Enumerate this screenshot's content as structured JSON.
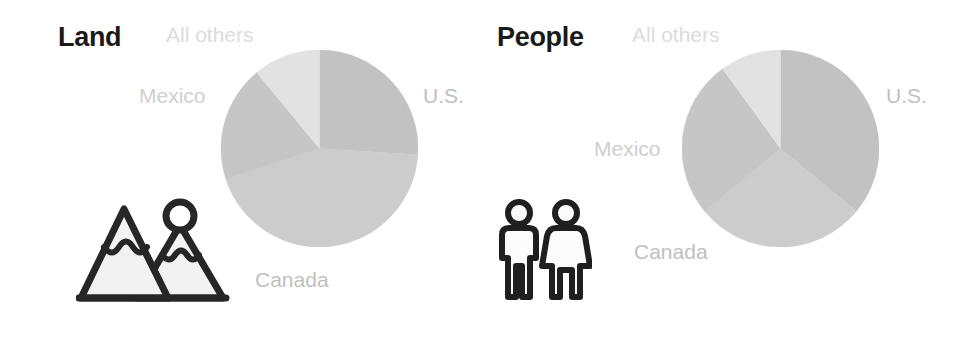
{
  "figure": {
    "background_color": "#ffffff",
    "width": 969,
    "height": 337
  },
  "panels": [
    {
      "id": "land",
      "title": "Land",
      "title_color": "#1a1a1a",
      "icon_name": "mountains-icon",
      "labels": {
        "us": "U.S.",
        "canada": "Canada",
        "mexico": "Mexico",
        "all_others": "All others"
      }
    },
    {
      "id": "people",
      "title": "People",
      "title_color": "#1a1a1a",
      "icon_name": "man-woman-icon",
      "labels": {
        "us": "U.S.",
        "canada": "Canada",
        "mexico": "Mexico",
        "all_others": "All others"
      }
    }
  ],
  "chart_data": [
    {
      "type": "pie",
      "title": "Land",
      "categories": [
        "U.S.",
        "Canada",
        "Mexico",
        "All others"
      ],
      "values": [
        26,
        44,
        19,
        11
      ],
      "unit": "percent",
      "colors": [
        "#c2c2c2",
        "#cccccc",
        "#c6c6c6",
        "#e2e2e2"
      ],
      "start_angle_deg": 0,
      "direction": "clockwise",
      "legend": "labels placed outside slices",
      "center": [
        320,
        149
      ],
      "radius": 98
    },
    {
      "type": "pie",
      "title": "People",
      "categories": [
        "U.S.",
        "Canada",
        "Mexico",
        "All others"
      ],
      "values": [
        36,
        28,
        26,
        10
      ],
      "unit": "percent",
      "colors": [
        "#c2c2c2",
        "#cccccc",
        "#c6c6c6",
        "#e2e2e2"
      ],
      "start_angle_deg": 0,
      "direction": "clockwise",
      "legend": "labels placed outside slices",
      "center": [
        781,
        149
      ],
      "radius": 98
    }
  ]
}
